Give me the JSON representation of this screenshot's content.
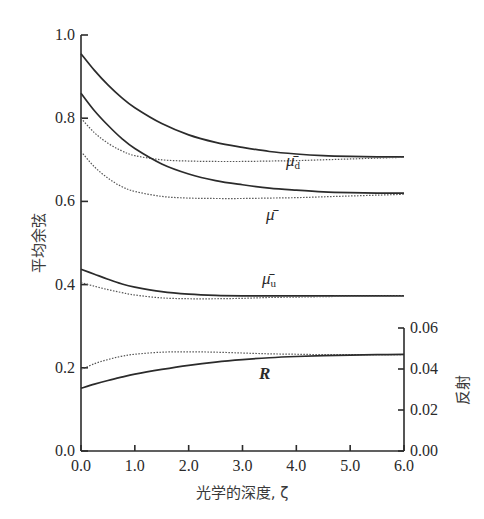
{
  "chart_data": {
    "type": "line",
    "title": "",
    "xlabel": "光学的深度, ζ",
    "ylabel": "平均余弦",
    "ylabel_right": "反射",
    "xlim": [
      0,
      6
    ],
    "ylim": [
      0,
      1.0
    ],
    "ylim_right": [
      0,
      0.06
    ],
    "x_ticks": [
      "0.0",
      "1.0",
      "2.0",
      "3.0",
      "4.0",
      "5.0",
      "6.0"
    ],
    "y_ticks": [
      "0.0",
      "0.2",
      "0.4",
      "0.6",
      "0.8",
      "1.0"
    ],
    "y_ticks_right": [
      "0.00",
      "0.02",
      "0.04",
      "0.06"
    ],
    "grid": false,
    "legend": "inline labels",
    "x": [
      0,
      0.25,
      0.5,
      0.75,
      1.0,
      1.5,
      2.0,
      2.5,
      3.0,
      3.5,
      4.0,
      4.5,
      5.0,
      5.5,
      6.0
    ],
    "series": [
      {
        "name": "μ̄d",
        "style": "solid",
        "axis": "left",
        "values": [
          0.955,
          0.915,
          0.88,
          0.85,
          0.825,
          0.787,
          0.76,
          0.742,
          0.73,
          0.72,
          0.714,
          0.71,
          0.708,
          0.707,
          0.707
        ]
      },
      {
        "name": "μ̄d (dotted)",
        "style": "dotted",
        "axis": "left",
        "values": [
          0.8,
          0.765,
          0.74,
          0.722,
          0.71,
          0.7,
          0.697,
          0.696,
          0.696,
          0.697,
          0.698,
          0.7,
          0.702,
          0.704,
          0.706
        ]
      },
      {
        "name": "μ̄",
        "style": "solid",
        "axis": "left",
        "values": [
          0.86,
          0.818,
          0.783,
          0.752,
          0.727,
          0.69,
          0.666,
          0.65,
          0.64,
          0.632,
          0.627,
          0.623,
          0.621,
          0.62,
          0.62
        ]
      },
      {
        "name": "μ̄ (dotted)",
        "style": "dotted",
        "axis": "left",
        "values": [
          0.72,
          0.683,
          0.656,
          0.636,
          0.624,
          0.612,
          0.608,
          0.607,
          0.607,
          0.608,
          0.609,
          0.611,
          0.613,
          0.615,
          0.617
        ]
      },
      {
        "name": "μ̄u",
        "style": "solid",
        "axis": "left",
        "values": [
          0.437,
          0.425,
          0.413,
          0.402,
          0.394,
          0.383,
          0.377,
          0.374,
          0.373,
          0.373,
          0.373,
          0.373,
          0.373,
          0.373,
          0.373
        ]
      },
      {
        "name": "μ̄u (dotted)",
        "style": "dotted",
        "axis": "left",
        "values": [
          0.405,
          0.396,
          0.388,
          0.381,
          0.375,
          0.368,
          0.366,
          0.366,
          0.367,
          0.369,
          0.37,
          0.371,
          0.372,
          0.372,
          0.373
        ]
      },
      {
        "name": "R (dotted)",
        "style": "dotted",
        "axis": "right",
        "values": [
          0.0396,
          0.0426,
          0.0446,
          0.0462,
          0.0472,
          0.0482,
          0.0484,
          0.0482,
          0.0478,
          0.0474,
          0.0472,
          0.047,
          0.047,
          0.047,
          0.047
        ]
      },
      {
        "name": "R",
        "style": "solid",
        "axis": "right",
        "values": [
          0.0306,
          0.0326,
          0.0344,
          0.036,
          0.0375,
          0.0398,
          0.0418,
          0.0434,
          0.0446,
          0.0455,
          0.0461,
          0.0465,
          0.0468,
          0.047,
          0.0471
        ]
      }
    ],
    "annotations": [
      {
        "text": "μ̄d",
        "x": 3.8,
        "y": 0.78
      },
      {
        "text": "μ̄",
        "x": 3.6,
        "y": 0.56
      },
      {
        "text": "μ̄u",
        "x": 3.5,
        "y": 0.41
      },
      {
        "text": "R",
        "x": 3.6,
        "y": 0.18
      }
    ]
  },
  "labels": {
    "xlabel": "光学的深度, ζ",
    "ylabel": "平均余弦",
    "ylabel_right": "反射",
    "mu_d": "μ̄",
    "mu_d_sub": "d",
    "mu": "μ̄",
    "mu_u": "μ̄",
    "mu_u_sub": "u",
    "R": "R"
  },
  "style": {
    "line_color": "#2b2b2b",
    "dot_color": "#555555",
    "axis_color": "#2b2b2b"
  }
}
